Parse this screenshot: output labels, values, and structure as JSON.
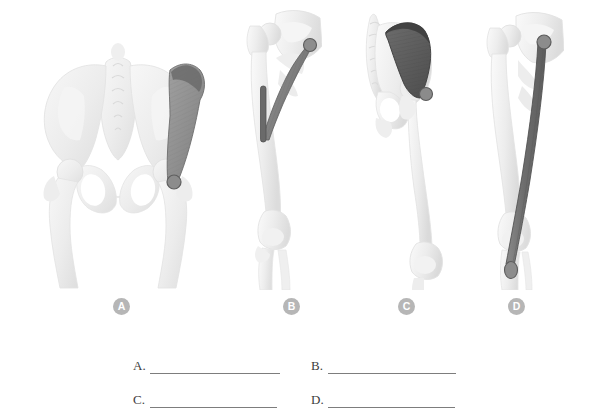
{
  "figure": {
    "caption_badges": [
      {
        "key": "A",
        "label": "A",
        "x": 113,
        "y": 298
      },
      {
        "key": "B",
        "label": "B",
        "x": 283,
        "y": 298
      },
      {
        "key": "C",
        "label": "C",
        "x": 398,
        "y": 298
      },
      {
        "key": "D",
        "label": "D",
        "x": 508,
        "y": 298
      }
    ],
    "panels": [
      {
        "badge": "A",
        "view": "anterior pelvis",
        "bone_structure": "pelvis with sacrum, both hip joints and proximal femurs",
        "highlighted_muscle": "fan-shaped muscle from iliac crest to greater trochanter",
        "muscle_color": "#8f8f8f",
        "origin_marker": "superior ridge band",
        "insertion_marker": "round dot at greater trochanter"
      },
      {
        "badge": "B",
        "view": "lateral hip and femur",
        "bone_structure": "hip joint, femur, knee joint and proximal tibia/fibula",
        "highlighted_muscle": "triangular muscle from posterior hip to proximal femoral shaft",
        "muscle_color": "#808080",
        "origin_marker": "round dot at posterior ilium",
        "insertion_marker": "elongated band on femoral shaft"
      },
      {
        "badge": "C",
        "view": "posterolateral pelvis and femur",
        "bone_structure": "sacrum, ilium, hip joint, femur and knee",
        "highlighted_muscle": "broad dark fan-shaped gluteal muscle over the ilium",
        "muscle_color": "#5e5e5e",
        "origin_marker": "arc band along iliac crest",
        "insertion_marker": "round dot at greater trochanter"
      },
      {
        "badge": "D",
        "view": "medial thigh",
        "bone_structure": "hip joint, femur, knee joint and tibia",
        "highlighted_muscle": "long slender strap muscle running from pelvis to medial tibia",
        "muscle_color": "#6e6e6e",
        "origin_marker": "round dot at ischiopubic ramus",
        "insertion_marker": "oval marker on medial proximal tibia"
      }
    ]
  },
  "answers": {
    "items": [
      {
        "label": "A.",
        "value": ""
      },
      {
        "label": "B.",
        "value": ""
      },
      {
        "label": "C.",
        "value": ""
      },
      {
        "label": "D.",
        "value": ""
      }
    ]
  },
  "colors": {
    "background": "#ffffff",
    "bone_light": "#f2f2f2",
    "bone_mid": "#e4e4e4",
    "bone_shadow": "#d2d2d2",
    "badge_fill": "#b6b6b6",
    "badge_text": "#ffffff",
    "rule_line": "#7d7d7d",
    "muscle_mid": "#8f8f8f",
    "muscle_dark": "#5e5e5e",
    "marker": "#8a8a8a"
  }
}
